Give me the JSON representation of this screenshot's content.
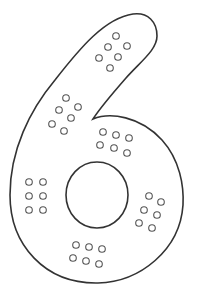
{
  "figure": {
    "digit": "6",
    "stroke_color": "#333333",
    "dot_color": "#555555",
    "background": "#ffffff",
    "dot_clusters": [
      {
        "name": "top",
        "count": 6,
        "dots": [
          [
            116,
            36
          ],
          [
            108,
            47
          ],
          [
            127,
            46
          ],
          [
            99,
            58
          ],
          [
            118,
            57
          ],
          [
            110,
            68
          ]
        ]
      },
      {
        "name": "upper-left",
        "count": 6,
        "dots": [
          [
            66,
            98
          ],
          [
            59,
            110
          ],
          [
            78,
            107
          ],
          [
            52,
            124
          ],
          [
            71,
            118
          ],
          [
            64,
            131
          ]
        ]
      },
      {
        "name": "middle",
        "count": 6,
        "dots": [
          [
            103,
            132
          ],
          [
            116,
            135
          ],
          [
            129,
            138
          ],
          [
            100,
            145
          ],
          [
            114,
            148
          ],
          [
            127,
            153
          ]
        ]
      },
      {
        "name": "left",
        "count": 6,
        "dots": [
          [
            29,
            182
          ],
          [
            43,
            182
          ],
          [
            29,
            196
          ],
          [
            43,
            196
          ],
          [
            29,
            210
          ],
          [
            43,
            210
          ]
        ]
      },
      {
        "name": "right",
        "count": 6,
        "dots": [
          [
            149,
            196
          ],
          [
            161,
            202
          ],
          [
            144,
            210
          ],
          [
            157,
            215
          ],
          [
            139,
            223
          ],
          [
            152,
            228
          ]
        ]
      },
      {
        "name": "bottom",
        "count": 6,
        "dots": [
          [
            76,
            245
          ],
          [
            89,
            247
          ],
          [
            102,
            249
          ],
          [
            73,
            258
          ],
          [
            86,
            261
          ],
          [
            99,
            264
          ]
        ]
      }
    ]
  }
}
